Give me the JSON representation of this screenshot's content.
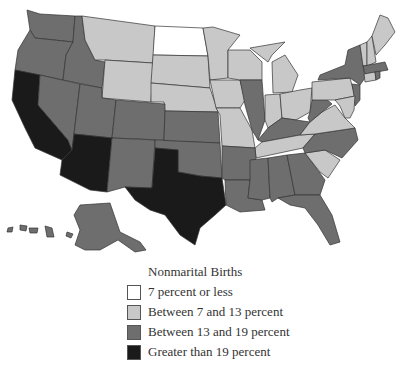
{
  "legend": {
    "title": "Nonmarital Births",
    "items": [
      {
        "label": "7 percent or less",
        "color": "#ffffff"
      },
      {
        "label": "Between 7 and 13 percent",
        "color": "#c8c8c8"
      },
      {
        "label": "Between 13 and 19 percent",
        "color": "#6e6e6e"
      },
      {
        "label": "Greater than 19 percent",
        "color": "#1a1a1a"
      }
    ]
  },
  "map_data": {
    "title": "Nonmarital Births",
    "categories": [
      "7 percent or less",
      "Between 7 and 13 percent",
      "Between 13 and 19 percent",
      "Greater than 19 percent"
    ],
    "states": {
      "7 percent or less": [
        "North Dakota"
      ],
      "Between 7 and 13 percent": [
        "Montana",
        "Wyoming",
        "South Dakota",
        "Nebraska",
        "Minnesota",
        "Wisconsin",
        "Michigan",
        "Iowa",
        "Missouri",
        "Indiana",
        "Ohio",
        "Pennsylvania",
        "Virginia",
        "Tennessee",
        "South Carolina",
        "Maine",
        "Vermont",
        "New Hampshire",
        "Connecticut",
        "Maryland",
        "Delaware"
      ],
      "Between 13 and 19 percent": [
        "Washington",
        "Oregon",
        "Idaho",
        "Nevada",
        "Utah",
        "Colorado",
        "New Mexico",
        "Kansas",
        "Oklahoma",
        "Arkansas",
        "Louisiana",
        "Mississippi",
        "Alabama",
        "Georgia",
        "Florida",
        "North Carolina",
        "Kentucky",
        "West Virginia",
        "Illinois",
        "New York",
        "New Jersey",
        "Massachusetts",
        "Rhode Island",
        "Alaska",
        "Hawaii"
      ],
      "Greater than 19 percent": [
        "California",
        "Arizona",
        "Texas"
      ]
    }
  }
}
